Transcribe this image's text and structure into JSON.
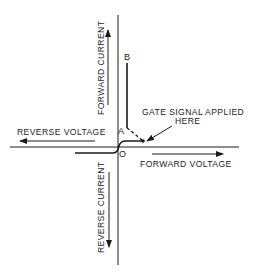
{
  "diagram": {
    "type": "SCR characteristic curve",
    "axes": {
      "y_positive_label": "FORWARD CURRENT",
      "y_negative_label": "REVERSE CURRENT",
      "x_positive_label": "FORWARD VOLTAGE",
      "x_negative_label": "REVERSE VOLTAGE"
    },
    "points": {
      "origin": "O",
      "a": "A",
      "b": "B"
    },
    "annotation": {
      "line1": "GATE SIGNAL APPLIED",
      "line2": "HERE"
    },
    "colors": {
      "ink": "#1a1a1a",
      "background": "#ffffff"
    }
  }
}
